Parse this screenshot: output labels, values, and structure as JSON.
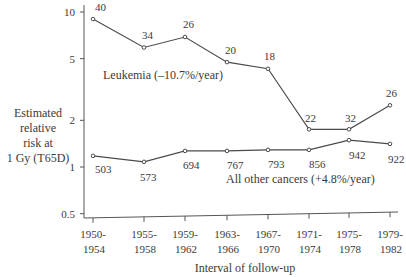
{
  "chart_data": {
    "type": "line",
    "title": "",
    "xlabel": "Interval of follow-up",
    "ylabel": [
      "Estimated",
      "relative",
      "risk at",
      "1 Gy (T65D)"
    ],
    "yscale": "log",
    "ylim": [
      0.5,
      10
    ],
    "yticks": [
      "10",
      "5",
      "2",
      "1",
      "0.5"
    ],
    "ytick_values": [
      10,
      5,
      2,
      1,
      0.5
    ],
    "categories": [
      "1950-1954",
      "1955-1958",
      "1959-1962",
      "1963-1966",
      "1967-1970",
      "1971-1974",
      "1975-1978",
      "1979-1982"
    ],
    "category_lines": [
      [
        "1950-",
        "1954"
      ],
      [
        "1955-",
        "1958"
      ],
      [
        "1959-",
        "1962"
      ],
      [
        "1963-",
        "1966"
      ],
      [
        "1967-",
        "1970"
      ],
      [
        "1971-",
        "1974"
      ],
      [
        "1975-",
        "1978"
      ],
      [
        "1979-",
        "1982"
      ]
    ],
    "series": [
      {
        "name": "Leukemia",
        "label": "Leukemia (–10.7%/year)",
        "values": [
          9.0,
          5.9,
          6.9,
          4.75,
          4.3,
          1.75,
          1.75,
          2.5
        ],
        "point_labels": [
          "40",
          "34",
          "26",
          "20",
          "18",
          "22",
          "32",
          "26"
        ]
      },
      {
        "name": "All other cancers",
        "label": "All other cancers (+4.8%/year)",
        "values": [
          1.18,
          1.08,
          1.27,
          1.27,
          1.29,
          1.29,
          1.49,
          1.41
        ],
        "point_labels": [
          "503",
          "573",
          "694",
          "767",
          "793",
          "856",
          "942",
          "922"
        ]
      }
    ],
    "grid": false,
    "legend": "inline labels"
  },
  "colors": {
    "line": "#4a4a4a",
    "text": "#3a3a3a",
    "axis": "#555555"
  }
}
